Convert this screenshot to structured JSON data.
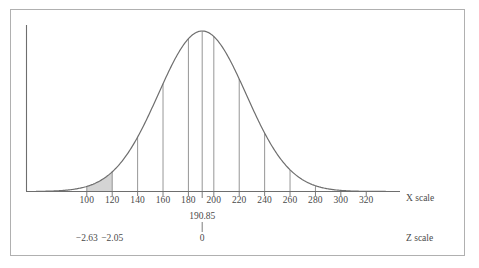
{
  "figure": {
    "kind": "normal-distribution-curve",
    "border_color": "#b0b0b0",
    "background": "#ffffff",
    "curve_color": "#6e6e6e",
    "shade_color": "#d4d4d4",
    "text_color": "#4a4a4a"
  },
  "axes": {
    "x_scale_label": "X scale",
    "z_scale_label": "Z scale"
  },
  "annotations": {
    "mean_value": "190.85",
    "mean_z": "0",
    "z_left_outer": "−2.63",
    "z_left_inner": "−2.05"
  },
  "chart_data": {
    "type": "area",
    "title": "",
    "subtitle": "",
    "xlabel": "X scale",
    "ylabel": "",
    "secondary_xlabel": "Z scale",
    "grid": false,
    "legend": "none",
    "distribution": {
      "name": "normal",
      "mean": 190.85,
      "std_dev": 34.57,
      "peak_x": 190.85
    },
    "xlim": [
      60,
      345
    ],
    "ylim": [
      0,
      1.0
    ],
    "x_ticks": [
      100,
      120,
      140,
      160,
      180,
      200,
      220,
      240,
      260,
      280,
      300,
      320
    ],
    "x_tick_labels": [
      "100",
      "120",
      "140",
      "160",
      "180",
      "200",
      "220",
      "240",
      "260",
      "280",
      "300",
      "320"
    ],
    "mean_tick": {
      "x": 190.85,
      "x_label": "190.85",
      "z_label": "0"
    },
    "z_ticks": [
      {
        "x": 100,
        "z_label": "−2.63"
      },
      {
        "x": 120,
        "z_label": "−2.05"
      }
    ],
    "ordinate_lines_at_x": [
      100,
      120,
      140,
      160,
      180,
      190.85,
      200,
      220,
      240,
      260,
      280
    ],
    "shaded_region": {
      "from_x": 100,
      "to_x": 120,
      "fill": "#d4d4d4",
      "label": ""
    },
    "vertical_axis": {
      "shown": true,
      "at_x": 65,
      "ticks": []
    }
  }
}
